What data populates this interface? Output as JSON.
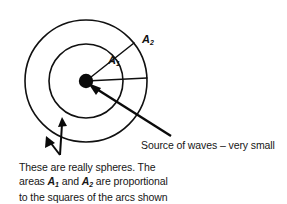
{
  "figure": {
    "background_color": "#ffffff",
    "ink_color": "#101010"
  },
  "diagram": {
    "source_dot": {
      "label": "source-of-waves",
      "center_x": 86,
      "center_y": 81,
      "radius": 7
    },
    "circles": [
      {
        "name": "inner-wavefront",
        "radius": 37,
        "associated_area": "A1"
      },
      {
        "name": "outer-wavefront",
        "radius": 61,
        "associated_area": "A2"
      }
    ],
    "sector": {
      "start_angle_deg": -38,
      "end_angle_deg": -3
    },
    "area_labels": [
      {
        "id": "A2",
        "letter": "A",
        "subscript": "2"
      },
      {
        "id": "A1",
        "letter": "A",
        "subscript": "1"
      }
    ]
  },
  "annotations": {
    "source_label": "Source of waves – very small",
    "notes": {
      "line1": "These are really spheres. The",
      "line2_prefix": "areas ",
      "line2_sym1_letter": "A",
      "line2_sym1_sub": "1",
      "line2_mid": " and ",
      "line2_sym2_letter": "A",
      "line2_sym2_sub": "2",
      "line2_suffix": " are proportional",
      "line3": "to the squares of the arcs shown"
    }
  }
}
